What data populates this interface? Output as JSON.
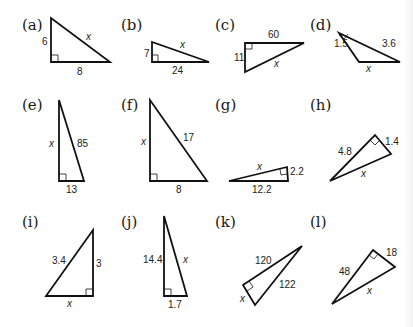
{
  "triangles": [
    {
      "label": "(a)",
      "sides": {
        "leg1": "6",
        "leg2": "8",
        "hyp": "x"
      },
      "unknown": "hypotenuse"
    },
    {
      "label": "(b)",
      "sides": {
        "leg1": "7",
        "leg2": "24",
        "hyp": "x"
      },
      "unknown": "hypotenuse"
    },
    {
      "label": "(c)",
      "sides": {
        "leg1": "11",
        "leg2": "60",
        "hyp": "x"
      },
      "unknown": "hypotenuse"
    },
    {
      "label": "(d)",
      "sides": {
        "leg1": "1.5",
        "leg2": "3.6",
        "hyp": "x"
      },
      "unknown": "hypotenuse"
    },
    {
      "label": "(e)",
      "sides": {
        "leg1": "x",
        "leg2": "13",
        "hyp": "85"
      },
      "unknown": "leg"
    },
    {
      "label": "(f)",
      "sides": {
        "leg1": "x",
        "leg2": "8",
        "hyp": "17"
      },
      "unknown": "leg"
    },
    {
      "label": "(g)",
      "sides": {
        "leg1": "12.2",
        "leg2": "2.2",
        "hyp": "x"
      },
      "unknown": "hypotenuse"
    },
    {
      "label": "(h)",
      "sides": {
        "leg1": "4.8",
        "leg2": "1.4",
        "hyp": "x"
      },
      "unknown": "hypotenuse"
    },
    {
      "label": "(i)",
      "sides": {
        "leg1": "x",
        "leg2": "3",
        "hyp": "3.4"
      },
      "unknown": "leg"
    },
    {
      "label": "(j)",
      "sides": {
        "leg1": "14.4",
        "leg2": "1.7",
        "hyp": "x"
      },
      "unknown": "hypotenuse"
    },
    {
      "label": "(k)",
      "sides": {
        "leg1": "120",
        "leg2": "x",
        "hyp": "122"
      },
      "unknown": "leg"
    },
    {
      "label": "(l)",
      "sides": {
        "leg1": "48",
        "leg2": "18",
        "hyp": "x"
      },
      "unknown": "hypotenuse"
    }
  ]
}
